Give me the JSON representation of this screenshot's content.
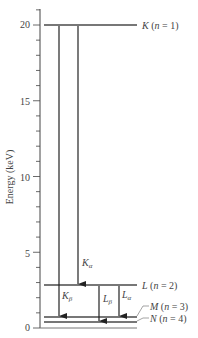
{
  "diagram": {
    "y_axis": {
      "label": "Energy (keV)",
      "min": 0,
      "max": 21,
      "major_ticks": [
        {
          "value": 0,
          "label": "0"
        },
        {
          "value": 5,
          "label": "5"
        },
        {
          "value": 10,
          "label": "10"
        },
        {
          "value": 15,
          "label": "15"
        },
        {
          "value": 20,
          "label": "20"
        }
      ],
      "minor_tick_step": 1
    },
    "levels": [
      {
        "name": "K",
        "n": "1",
        "label": "K (n = 1)",
        "energy": 20
      },
      {
        "name": "L",
        "n": "2",
        "label": "L (n = 2)",
        "energy": 3
      },
      {
        "name": "M",
        "n": "3",
        "label": "M (n = 3)",
        "energy": 0.7
      },
      {
        "name": "N",
        "n": "4",
        "label": "N (n = 4)",
        "energy": 0.4
      }
    ],
    "transitions": [
      {
        "label": "K",
        "sub": "β",
        "from": "K",
        "to": "M"
      },
      {
        "label": "K",
        "sub": "α",
        "from": "K",
        "to": "L"
      },
      {
        "label": "L",
        "sub": "β",
        "from": "L",
        "to": "N"
      },
      {
        "label": "L",
        "sub": "α",
        "from": "L",
        "to": "M"
      }
    ],
    "colors": {
      "level_line": "#777777",
      "arrow": "#222222",
      "axis": "#444444",
      "text": "#444444"
    }
  }
}
